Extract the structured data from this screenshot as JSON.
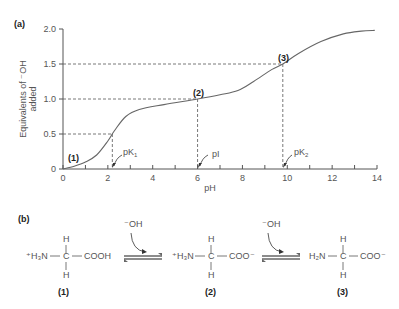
{
  "panel_a_label": "(a)",
  "panel_b_label": "(b)",
  "chart_data": {
    "type": "line",
    "title": "",
    "xlabel": "pH",
    "ylabel": "Equivalents of ⁻OH added",
    "xlim": [
      0,
      14
    ],
    "ylim": [
      0,
      2.0
    ],
    "xticks": [
      "0",
      "2",
      "4",
      "6",
      "8",
      "10",
      "12",
      "14"
    ],
    "yticks": [
      "0",
      "0.5",
      "1.0",
      "1.5",
      "2.0"
    ],
    "grid": false,
    "series": [
      {
        "name": "Titration curve",
        "x": [
          0,
          0.5,
          1.0,
          1.5,
          2.0,
          2.3,
          2.8,
          3.4,
          4.5,
          6.0,
          7.0,
          7.8,
          8.5,
          9.3,
          9.8,
          10.5,
          11.5,
          12.5,
          13.3,
          13.9
        ],
        "y": [
          0,
          0.04,
          0.1,
          0.2,
          0.4,
          0.55,
          0.75,
          0.85,
          0.92,
          1.0,
          1.06,
          1.12,
          1.25,
          1.42,
          1.5,
          1.65,
          1.82,
          1.93,
          1.97,
          1.98
        ]
      }
    ],
    "annotations": [
      {
        "text": "(1)",
        "x": 0.3,
        "y": 0.05
      },
      {
        "text": "(2)",
        "x": 6.0,
        "y": 1.0
      },
      {
        "text": "(3)",
        "x": 9.8,
        "y": 1.5
      },
      {
        "text": "pK₁",
        "x": 2.2,
        "y": 0,
        "arrow": true
      },
      {
        "text": "pI",
        "x": 6.0,
        "y": 0,
        "arrow": true
      },
      {
        "text": "pK₂",
        "x": 9.8,
        "y": 0,
        "arrow": true
      }
    ],
    "reference_lines": [
      {
        "y": 0.5,
        "x": 2.2
      },
      {
        "y": 1.0,
        "x": 6.0
      },
      {
        "y": 1.5,
        "x": 9.8
      }
    ]
  },
  "labels": {
    "pt1": "(1)",
    "pt2": "(2)",
    "pt3": "(3)",
    "pk1": "pK",
    "pk1_sub": "1",
    "pi": "pI",
    "pk2": "pK",
    "pk2_sub": "2",
    "ylabel_line1": "Equivalents of ⁻OH",
    "ylabel_line2": "added"
  },
  "reaction": {
    "reagent": "⁻OH",
    "species": [
      {
        "label": "(1)",
        "left": "⁺H₃N",
        "center": "C",
        "right": "COOH",
        "top": "H",
        "bottom": "H"
      },
      {
        "label": "(2)",
        "left": "⁺H₃N",
        "center": "C",
        "right": "COO⁻",
        "top": "H",
        "bottom": "H"
      },
      {
        "label": "(3)",
        "left": "H₂N",
        "center": "C",
        "right": "COO⁻",
        "top": "H",
        "bottom": "H"
      }
    ]
  }
}
